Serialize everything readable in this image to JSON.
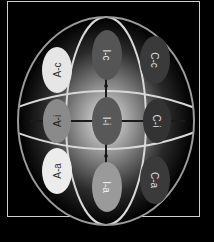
{
  "diagram": {
    "type": "sphere-grid",
    "rows": [
      "c",
      "i",
      "a"
    ],
    "columns": [
      "A",
      "I",
      "C"
    ],
    "nodes": [
      {
        "id": "A-c",
        "label": "A-c",
        "fill": "#e6e6e6",
        "text": "#333333"
      },
      {
        "id": "I-c",
        "label": "I-c",
        "fill": "#555555",
        "text": "#f0f0f0"
      },
      {
        "id": "C-c",
        "label": "C-c",
        "fill": "#3a3a3a",
        "text": "#e0e0e0"
      },
      {
        "id": "A-i",
        "label": "A-i",
        "fill": "#8a8a8a",
        "text": "#222222"
      },
      {
        "id": "I-i",
        "label": "I-i",
        "fill": "#585858",
        "text": "#f0f0f0"
      },
      {
        "id": "C-i",
        "label": "C-i",
        "fill": "#333333",
        "text": "#e0e0e0"
      },
      {
        "id": "A-a",
        "label": "A-a",
        "fill": "#ececec",
        "text": "#333333"
      },
      {
        "id": "I-a",
        "label": "I-a",
        "fill": "#9a9a9a",
        "text": "#f5f5f5"
      },
      {
        "id": "C-a",
        "label": "C-a",
        "fill": "#3a3a3a",
        "text": "#e0e0e0"
      }
    ],
    "colors": {
      "background": "#000000",
      "frame": "#cfcfcf",
      "sphere_outline": "#9a9a9a",
      "grid_lines": "#d8d8d8",
      "connectors": "#1a1a1a"
    }
  }
}
